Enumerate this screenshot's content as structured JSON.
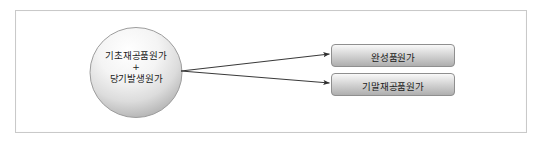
{
  "diagram": {
    "source_node": {
      "shape": "ellipse",
      "lines": [
        "기초재공품원가",
        "+",
        "당기발생원가"
      ],
      "line1": "기초재공품원가",
      "line2": "+",
      "line3": "당기발생원가"
    },
    "targets": [
      {
        "label": "완성품원가"
      },
      {
        "label": "기말재공품원가"
      }
    ],
    "connectors": [
      {
        "from": "source_node",
        "to": "완성품원가",
        "style": "arrow"
      },
      {
        "from": "source_node",
        "to": "기말재공품원가",
        "style": "arrow"
      }
    ],
    "colors": {
      "frame_border": "#c9c9c9",
      "background": "#ffffff",
      "node_fill_light": "#fbfbfb",
      "node_fill_dark": "#b8b8b8",
      "node_border": "#9a9a9a",
      "box_fill_light": "#f2f2f2",
      "box_fill_dark": "#b4b4b4",
      "box_border": "#8f8f8f",
      "connector": "#3a3a3a",
      "text": "#1b1b1b"
    }
  }
}
